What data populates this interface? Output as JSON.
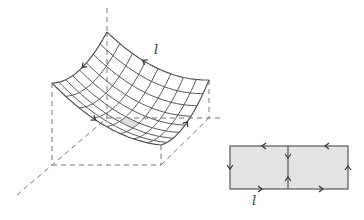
{
  "surface": {
    "corners": {
      "top": [
        107,
        32
      ],
      "left": [
        52,
        83
      ],
      "bottom": [
        161,
        145
      ],
      "right": [
        209,
        80
      ]
    },
    "sag": 14,
    "grid_divisions": 8,
    "shaded_cell": [
      4,
      5
    ],
    "stroke_color": "#555555",
    "shade_color": "#dddddd"
  },
  "axes": {
    "dash_color": "#777777",
    "lines": [
      [
        [
          107,
          8
        ],
        [
          107,
          32
        ]
      ],
      [
        [
          107,
          32
        ],
        [
          107,
          118
        ]
      ],
      [
        [
          52,
          83
        ],
        [
          52,
          165
        ]
      ],
      [
        [
          209,
          80
        ],
        [
          209,
          118
        ]
      ],
      [
        [
          161,
          145
        ],
        [
          161,
          165
        ]
      ],
      [
        [
          52,
          165
        ],
        [
          161,
          165
        ]
      ],
      [
        [
          107,
          118
        ],
        [
          220,
          118
        ]
      ],
      [
        [
          161,
          165
        ],
        [
          209,
          118
        ]
      ],
      [
        [
          17,
          195
        ],
        [
          107,
          118
        ]
      ]
    ]
  },
  "labels": {
    "surface_l": "l",
    "rect_l": "l"
  },
  "rectangle": {
    "x": 230,
    "y": 146,
    "w": 118,
    "h": 43,
    "divider_x": 288,
    "fill": "#e3e3e3",
    "stroke": "#555555"
  }
}
